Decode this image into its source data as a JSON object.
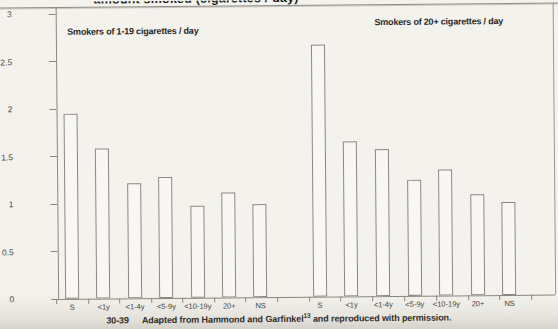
{
  "page": {
    "heading_fragment": "amount smoked (cigarettes / day)",
    "caption": {
      "figure_number": "30-39",
      "before_sup": "Adapted from Hammond and Garfinkel",
      "sup": "13",
      "after_sup": " and reproduced with permission."
    }
  },
  "chart_data": {
    "type": "bar",
    "title": "",
    "xlabel": "",
    "ylabel": "",
    "ylim": [
      0,
      3
    ],
    "yticks": [
      0,
      0.5,
      1,
      1.5,
      2,
      2.5,
      3
    ],
    "grid": false,
    "categories": [
      "S",
      "<1y",
      "<1-4y",
      "<5-9y",
      "<10-19y",
      "20+",
      "NS"
    ],
    "series": [
      {
        "name": "Smokers of 1-19 cigarettes / day",
        "values": [
          1.95,
          1.58,
          1.21,
          1.27,
          0.97,
          1.11,
          0.98
        ]
      },
      {
        "name": "Smokers of 20+ cigarettes / day",
        "values": [
          2.65,
          1.63,
          1.55,
          1.22,
          1.33,
          1.06,
          0.98
        ]
      }
    ],
    "bar_fill": "#f8f7f3",
    "bar_border": "#8a8880",
    "axis_color": "#8a8780"
  }
}
